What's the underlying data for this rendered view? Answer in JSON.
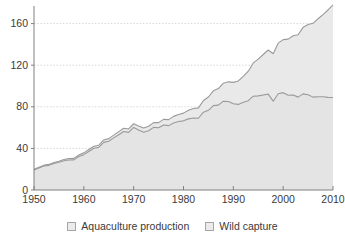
{
  "chart_data": {
    "type": "area",
    "stacked": true,
    "title": "",
    "subtitle": "",
    "xlabel": "",
    "ylabel": "",
    "xlim": [
      1950,
      2010
    ],
    "ylim": [
      0,
      175
    ],
    "grid": true,
    "legend_position": "bottom",
    "xticks": [
      1950,
      1960,
      1970,
      1980,
      1990,
      2000,
      2010
    ],
    "yticks": [
      0,
      40,
      80,
      120,
      160
    ],
    "gridline_values": [
      40,
      80,
      120,
      160
    ],
    "colors": {
      "area_fill": "#e9e9e9",
      "line": "#9a9a9a",
      "gridline": "#cfcfcf",
      "axis": "#808080",
      "text": "#3a3a3a"
    },
    "x": [
      1950,
      1951,
      1952,
      1953,
      1954,
      1955,
      1956,
      1957,
      1958,
      1959,
      1960,
      1961,
      1962,
      1963,
      1964,
      1965,
      1966,
      1967,
      1968,
      1969,
      1970,
      1971,
      1972,
      1973,
      1974,
      1975,
      1976,
      1977,
      1978,
      1979,
      1980,
      1981,
      1982,
      1983,
      1984,
      1985,
      1986,
      1987,
      1988,
      1989,
      1990,
      1991,
      1992,
      1993,
      1994,
      1995,
      1996,
      1997,
      1998,
      1999,
      2000,
      2001,
      2002,
      2003,
      2004,
      2005,
      2006,
      2007,
      2008,
      2009,
      2010
    ],
    "series": [
      {
        "name": "Wild capture",
        "values": [
          19.3,
          21.2,
          23.1,
          23.7,
          25.4,
          26.6,
          28.1,
          28.9,
          29.0,
          32.2,
          34.0,
          37.1,
          40.1,
          41.0,
          45.8,
          46.9,
          50.1,
          53.2,
          56.3,
          55.4,
          60.2,
          57.8,
          55.6,
          57.0,
          60.2,
          59.8,
          62.5,
          61.9,
          64.5,
          65.8,
          66.5,
          68.4,
          69.3,
          69.0,
          74.8,
          76.6,
          81.1,
          81.6,
          85.4,
          85.1,
          82.9,
          82.3,
          84.3,
          85.9,
          90.2,
          90.5,
          91.4,
          92.2,
          85.4,
          92.6,
          93.6,
          91.1,
          91.3,
          89.3,
          92.4,
          91.6,
          89.3,
          89.7,
          89.7,
          89.1,
          89.0
        ]
      },
      {
        "name": "Aquaculture production",
        "values": [
          0.6,
          0.7,
          0.8,
          0.9,
          1.0,
          1.1,
          1.2,
          1.3,
          1.4,
          1.5,
          1.7,
          1.8,
          2.0,
          2.1,
          2.3,
          2.5,
          2.7,
          2.9,
          3.1,
          3.3,
          3.5,
          3.7,
          4.0,
          4.3,
          4.6,
          5.0,
          5.4,
          5.8,
          6.3,
          6.8,
          7.4,
          8.2,
          9.0,
          10.0,
          11.3,
          12.8,
          14.3,
          15.9,
          17.3,
          18.9,
          20.6,
          22.6,
          24.9,
          28.3,
          32.0,
          35.4,
          38.9,
          42.4,
          45.6,
          48.6,
          51.0,
          54.0,
          57.0,
          60.0,
          64.0,
          67.5,
          71.0,
          75.0,
          79.0,
          84.0,
          89.0
        ]
      }
    ],
    "totals": [
      19.9,
      21.9,
      23.9,
      24.6,
      26.4,
      27.7,
      29.3,
      30.2,
      30.4,
      33.7,
      35.7,
      38.9,
      42.1,
      43.1,
      48.1,
      49.4,
      52.8,
      56.1,
      59.4,
      58.7,
      63.7,
      61.5,
      59.6,
      61.3,
      64.8,
      64.8,
      67.9,
      67.7,
      70.8,
      72.6,
      73.9,
      76.6,
      78.3,
      79.0,
      86.1,
      89.4,
      95.4,
      97.5,
      102.7,
      104.0,
      103.5,
      104.9,
      109.2,
      114.2,
      122.2,
      125.9,
      130.3,
      134.6,
      131.0,
      141.2,
      144.6,
      145.1,
      148.3,
      149.3,
      156.4,
      159.1,
      160.3,
      164.7,
      168.7,
      173.1,
      178.0
    ]
  },
  "legend": {
    "items": [
      {
        "label": "Aquaculture production"
      },
      {
        "label": "Wild capture"
      }
    ]
  }
}
